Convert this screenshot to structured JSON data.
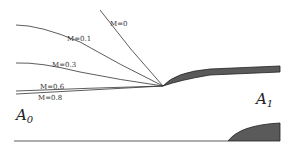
{
  "diagram": {
    "type": "streamlines around leading edge",
    "curves": [
      {
        "label": "M=0",
        "name": "streamline-m0"
      },
      {
        "label": "M=0.1",
        "name": "streamline-m01"
      },
      {
        "label": "M=0.3",
        "name": "streamline-m03"
      },
      {
        "label": "M=0.6",
        "name": "streamline-m06"
      },
      {
        "label": "M=0.8",
        "name": "streamline-m08"
      }
    ],
    "regions": {
      "a0": {
        "letter": "A",
        "sub": "0"
      },
      "a1": {
        "letter": "A",
        "sub": "1"
      }
    },
    "colors": {
      "line": "#333333",
      "body_fill": "#5a5a5a",
      "background": "#ffffff"
    }
  }
}
